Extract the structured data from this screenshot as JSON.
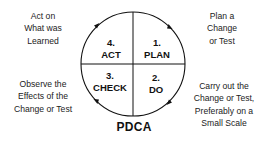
{
  "diagram": {
    "title": "PDCA",
    "colors": {
      "line": "#111111",
      "text": "#222222",
      "background": "#ffffff"
    },
    "quadrants": [
      {
        "number": "1.",
        "label": "PLAN",
        "position": "top-right"
      },
      {
        "number": "2.",
        "label": "DO",
        "position": "bottom-right"
      },
      {
        "number": "3.",
        "label": "CHECK",
        "position": "bottom-left"
      },
      {
        "number": "4.",
        "label": "ACT",
        "position": "top-left"
      }
    ],
    "notes": {
      "plan": [
        "Plan a",
        "Change",
        "or Test"
      ],
      "do": [
        "Carry out the",
        "Change or Test,",
        "Preferably on a",
        "Small Scale"
      ],
      "check": [
        "Observe the",
        "Effects of the",
        "Change or Test"
      ],
      "act": [
        "Act on",
        "What was",
        "Learned"
      ]
    },
    "arrows": [
      "top-left-clockwise-arrow",
      "top-right-clockwise-arrow",
      "bottom-right-clockwise-arrow",
      "bottom-left-clockwise-arrow"
    ]
  }
}
